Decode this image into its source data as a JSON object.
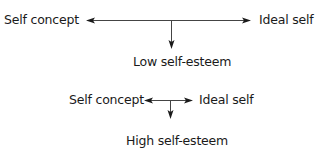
{
  "diagram_low": {
    "left_label": "Self concept",
    "right_label": "Ideal self",
    "result_label": "Low self-esteem"
  },
  "diagram_high": {
    "left_label": "Self concept",
    "right_label": "Ideal self",
    "result_label": "High self-esteem"
  },
  "colors": {
    "line": "#444444",
    "text": "#1a1a1a"
  }
}
